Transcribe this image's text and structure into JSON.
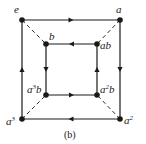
{
  "diagram": {
    "caption": "(b)",
    "colors": {
      "ink": "#1a1a1a",
      "background": "#ffffff"
    },
    "nodes": [
      {
        "id": "e",
        "label": "e",
        "base": "e",
        "sup": "",
        "suffix": "",
        "x": 22,
        "y": 20
      },
      {
        "id": "a",
        "label": "a",
        "base": "a",
        "sup": "",
        "suffix": "",
        "x": 120,
        "y": 20
      },
      {
        "id": "b",
        "label": "b",
        "base": "b",
        "sup": "",
        "suffix": "",
        "x": 46,
        "y": 44
      },
      {
        "id": "ab",
        "label": "ab",
        "base": "ab",
        "sup": "",
        "suffix": "",
        "x": 97,
        "y": 44
      },
      {
        "id": "a3b",
        "label": "a³b",
        "base": "a",
        "sup": "3",
        "suffix": "b",
        "x": 46,
        "y": 95
      },
      {
        "id": "a2b",
        "label": "a²b",
        "base": "a",
        "sup": "2",
        "suffix": "b",
        "x": 97,
        "y": 95
      },
      {
        "id": "a3",
        "label": "a³",
        "base": "a",
        "sup": "3",
        "suffix": "",
        "x": 22,
        "y": 119
      },
      {
        "id": "a2",
        "label": "a²",
        "base": "a",
        "sup": "2",
        "suffix": "",
        "x": 120,
        "y": 119
      }
    ],
    "directed_edges": [
      {
        "from": "e",
        "to": "a",
        "style": "solid"
      },
      {
        "from": "a",
        "to": "a2",
        "style": "solid"
      },
      {
        "from": "a2",
        "to": "a3",
        "style": "solid"
      },
      {
        "from": "a3",
        "to": "e",
        "style": "solid"
      },
      {
        "from": "ab",
        "to": "b",
        "style": "solid"
      },
      {
        "from": "b",
        "to": "a3b",
        "style": "solid"
      },
      {
        "from": "a3b",
        "to": "a2b",
        "style": "solid"
      },
      {
        "from": "a2b",
        "to": "ab",
        "style": "solid"
      }
    ],
    "undirected_edges": [
      {
        "from": "e",
        "to": "b",
        "style": "dashed"
      },
      {
        "from": "a",
        "to": "ab",
        "style": "dashed"
      },
      {
        "from": "a2",
        "to": "a2b",
        "style": "dashed"
      },
      {
        "from": "a3",
        "to": "a3b",
        "style": "dashed"
      }
    ]
  }
}
